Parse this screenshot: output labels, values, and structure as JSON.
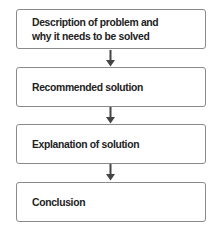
{
  "flowchart": {
    "steps": [
      {
        "label": "Description of problem and\nwhy it needs to be solved"
      },
      {
        "label": "Recommended solution"
      },
      {
        "label": "Explanation of solution"
      },
      {
        "label": "Conclusion"
      }
    ],
    "connector_icon": "arrow-down-icon",
    "colors": {
      "box_border": "#8a8a8a",
      "text": "#222222",
      "arrow": "#444444",
      "background": "#ffffff"
    }
  }
}
